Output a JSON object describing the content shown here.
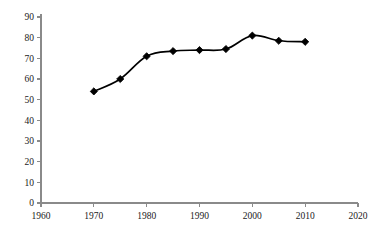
{
  "chart_data": {
    "type": "line",
    "title": "",
    "subtitle": "",
    "xlabel": "",
    "ylabel": "",
    "x": [
      1970,
      1975,
      1980,
      1985,
      1990,
      1995,
      2000,
      2005,
      2010
    ],
    "values": [
      54,
      60,
      71,
      73.5,
      74,
      74.5,
      81,
      78.5,
      78
    ],
    "series": [
      {
        "name": "",
        "x": [
          1970,
          1975,
          1980,
          1985,
          1990,
          1995,
          2000,
          2005,
          2010
        ],
        "values": [
          54,
          60,
          71,
          73.5,
          74,
          74.5,
          81,
          78.5,
          78
        ]
      }
    ],
    "xlim": [
      1960,
      2020
    ],
    "ylim": [
      0,
      90
    ],
    "x_ticks": [
      1960,
      1970,
      1980,
      1990,
      2000,
      2010,
      2020
    ],
    "x_tick_labels": [
      "1960",
      "1970",
      "1980",
      "1990",
      "2000",
      "2010",
      "2020"
    ],
    "y_ticks": [
      0,
      10,
      20,
      30,
      40,
      50,
      60,
      70,
      80,
      90
    ],
    "y_tick_labels": [
      "0",
      "10",
      "20",
      "30",
      "40",
      "50",
      "60",
      "70",
      "80",
      "90"
    ],
    "grid": false,
    "legend": false,
    "legend_position": "none",
    "marker": "diamond",
    "line_color": "#000000",
    "marker_color": "#000000",
    "axis_color": "#8a8a8a",
    "background_color": "#ffffff",
    "annotations": []
  }
}
